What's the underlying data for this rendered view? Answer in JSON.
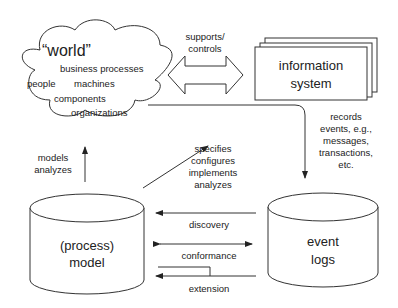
{
  "world": {
    "title": "“world”",
    "items": [
      "business processes",
      "people",
      "machines",
      "components",
      "organizations"
    ]
  },
  "information_system": {
    "line1": "information",
    "line2": "system"
  },
  "supports_controls": {
    "line1": "supports/",
    "line2": "controls"
  },
  "records": {
    "lines": [
      "records",
      "events, e.g.,",
      "messages,",
      "transactions,",
      "etc."
    ]
  },
  "models_analyzes": {
    "line1": "models",
    "line2": "analyzes"
  },
  "specifies": {
    "lines": [
      "specifies",
      "configures",
      "implements",
      "analyzes"
    ]
  },
  "process_model": {
    "line1": "(process)",
    "line2": "model"
  },
  "event_logs": {
    "line1": "event",
    "line2": "logs"
  },
  "relations": {
    "discovery": "discovery",
    "conformance": "conformance",
    "extension": "extension"
  }
}
